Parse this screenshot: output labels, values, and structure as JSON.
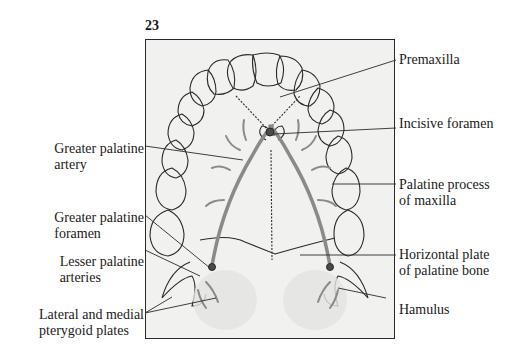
{
  "figure": {
    "number": "23"
  },
  "labels": {
    "left": [
      {
        "id": "greater-palatine-artery",
        "line1": "Greater palatine",
        "line2": "artery"
      },
      {
        "id": "greater-palatine-foramen",
        "line1": "Greater palatine",
        "line2": "foramen"
      },
      {
        "id": "lesser-palatine-arteries",
        "line1": "Lesser palatine",
        "line2": "arteries"
      },
      {
        "id": "pterygoid-plates",
        "line1": "Lateral and medial",
        "line2": "pterygoid plates"
      }
    ],
    "right": [
      {
        "id": "premaxilla",
        "line1": "Premaxilla",
        "line2": ""
      },
      {
        "id": "incisive-foramen",
        "line1": "Incisive foramen",
        "line2": ""
      },
      {
        "id": "palatine-process",
        "line1": "Palatine process",
        "line2": "of maxilla"
      },
      {
        "id": "horizontal-plate",
        "line1": "Horizontal plate",
        "line2": "of palatine bone"
      },
      {
        "id": "hamulus",
        "line1": "Hamulus",
        "line2": ""
      }
    ]
  },
  "colors": {
    "ink": "#2a2a2a",
    "artery": "#8a8a8a",
    "background": "#f1f1ef"
  }
}
